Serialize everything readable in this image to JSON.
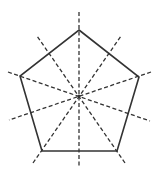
{
  "diagram": {
    "shape": "regular-pentagon",
    "stroke_color": "#333333",
    "symmetry_line_color": "#333333",
    "background": "#ffffff",
    "center": [
      79,
      96
    ],
    "vertices": [
      [
        79,
        30
      ],
      [
        139,
        77
      ],
      [
        117,
        151
      ],
      [
        42,
        151
      ],
      [
        20,
        76
      ]
    ],
    "lines_of_symmetry_count": 5,
    "symmetry_lines": [
      {
        "from": [
          79,
          12
        ],
        "to": [
          79,
          168
        ],
        "through": "top vertex and bottom edge midpoint"
      },
      {
        "from": [
          151,
          72
        ],
        "to": [
          9,
          120
        ],
        "through": "right vertex and lower-left edge midpoint"
      },
      {
        "from": [
          125,
          163
        ],
        "to": [
          37,
          36
        ],
        "through": "bottom-right vertex and upper-left edge midpoint"
      },
      {
        "from": [
          33,
          163
        ],
        "to": [
          121,
          36
        ],
        "through": "bottom-left vertex and upper-right edge midpoint"
      },
      {
        "from": [
          8,
          72
        ],
        "to": [
          150,
          121
        ],
        "through": "left vertex and lower-right edge midpoint"
      }
    ]
  }
}
